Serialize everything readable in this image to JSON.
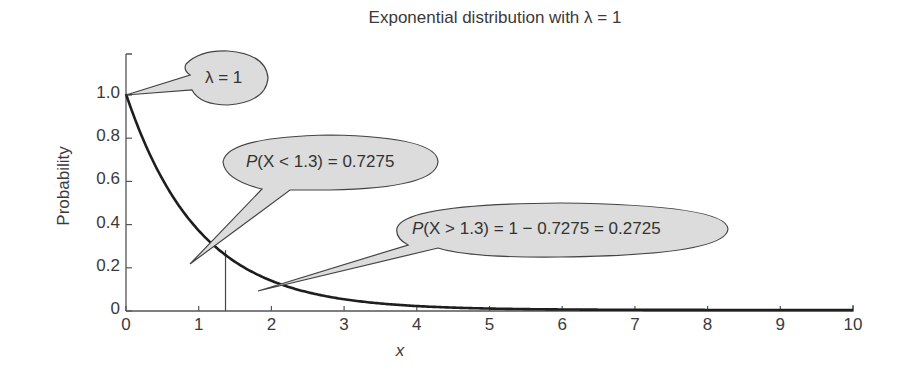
{
  "chart_data": {
    "type": "line",
    "title": "Exponential distribution with λ = 1",
    "xlabel": "x",
    "ylabel": "Probability",
    "xlim": [
      0,
      10
    ],
    "ylim": [
      0,
      1.15
    ],
    "xticks": [
      0,
      1,
      2,
      3,
      4,
      5,
      6,
      7,
      8,
      9,
      10
    ],
    "yticks": [
      0,
      0.2,
      0.4,
      0.6,
      0.8,
      1.0
    ],
    "ytick_labels": [
      "0",
      "0.2",
      "0.4",
      "0.6",
      "0.8",
      "1.0"
    ],
    "grid": false,
    "legend": null,
    "series": [
      {
        "name": "f(x) = λ e^(-λ x), λ = 1",
        "function": "exp(-x)",
        "x": [
          0,
          0.5,
          1,
          1.3,
          1.5,
          2,
          2.5,
          3,
          4,
          5,
          6,
          7,
          8,
          9,
          10
        ],
        "values": [
          1.0,
          0.607,
          0.368,
          0.273,
          0.223,
          0.135,
          0.082,
          0.05,
          0.018,
          0.007,
          0.002,
          0.001,
          0.0,
          0.0,
          0.0
        ]
      }
    ],
    "vertical_marker": {
      "x": 1.3,
      "label": "x = 1.3"
    },
    "annotations": [
      {
        "id": "lambda",
        "text": "λ = 1",
        "points_to": [
          0,
          1.0
        ]
      },
      {
        "id": "p_less",
        "text": "P(X < 1.3) = 0.7275",
        "points_to": [
          0.9,
          0.22
        ]
      },
      {
        "id": "p_greater",
        "text": "P(X > 1.3) = 1 − 0.7275 = 0.2725",
        "points_to": [
          1.8,
          0.09
        ]
      }
    ]
  },
  "labels": {
    "title": "Exponential distribution with λ = 1",
    "xlabel": "x",
    "ylabel": "Probability",
    "callout_lambda": "λ = 1",
    "callout_less_p": "P",
    "callout_less_rest": "(X < 1.3) = 0.7275",
    "callout_greater_p": "P",
    "callout_greater_rest": "(X > 1.3) = 1 − 0.7275 = 0.2725"
  },
  "colors": {
    "curve": "#1e1e1e",
    "axis": "#555555",
    "callout_fill": "#dcdcdc",
    "callout_stroke": "#444444"
  }
}
